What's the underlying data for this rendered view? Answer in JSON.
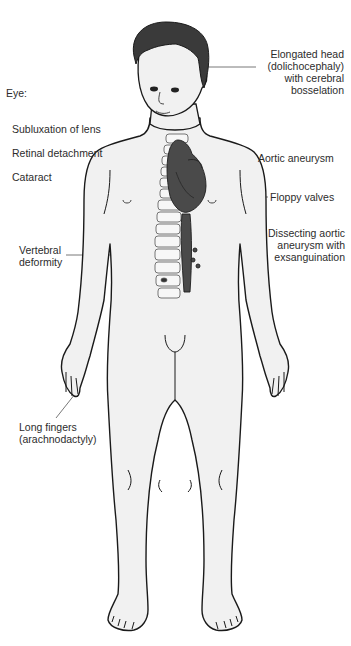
{
  "figure": {
    "colors": {
      "skin": "#f1f1f1",
      "outline": "#1a1a1a",
      "hair": "#3a3a3a",
      "heart": "#4a4a4a",
      "spine": "#f7f7f7",
      "leader_line": "#555555"
    }
  },
  "labels": {
    "eye": {
      "heading": "Eye:",
      "items": [
        "Subluxation of lens",
        "Retinal detachment",
        "Cataract"
      ]
    },
    "head": "Elongated head\n(dolichocephaly)\nwith cerebral\nbosselation",
    "aortic_aneurysm": "Aortic aneurysm",
    "floppy_valves": "Floppy valves",
    "dissecting": "Dissecting aortic\naneurysm with\nexsanguination",
    "vertebral": "Vertebral\ndeformity",
    "fingers": "Long fingers\n(arachnodactyly)"
  }
}
